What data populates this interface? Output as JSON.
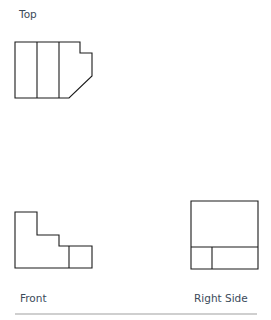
{
  "views": {
    "top": {
      "label": "Top",
      "outline": "15,42 80,42 80,53 92,53 92,76 69,98 15,98",
      "lines": [
        {
          "x1": 37,
          "y1": 42,
          "x2": 37,
          "y2": 98
        },
        {
          "x1": 59,
          "y1": 42,
          "x2": 59,
          "y2": 98
        }
      ]
    },
    "front": {
      "label": "Front",
      "outline": "15,212 37,212 37,235 59,235 59,246 92,246 92,268 15,268",
      "lines": [
        {
          "x1": 69,
          "y1": 246,
          "x2": 69,
          "y2": 268
        }
      ]
    },
    "right_side": {
      "label": "Right Side",
      "outline": "191,201 258,201 258,269 191,269",
      "lines": [
        {
          "x1": 191,
          "y1": 247,
          "x2": 258,
          "y2": 247
        },
        {
          "x1": 212,
          "y1": 247,
          "x2": 212,
          "y2": 269
        }
      ]
    }
  },
  "style": {
    "stroke_color": "#1a1a1a",
    "label_color": "#3b4a5a",
    "divider_color": "#cfcfcf"
  }
}
